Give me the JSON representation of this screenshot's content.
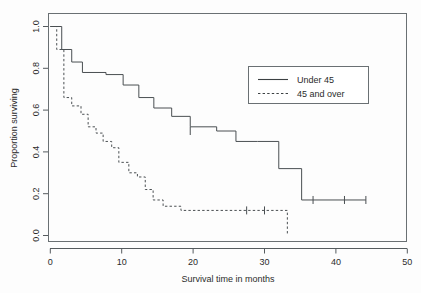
{
  "chart_data": {
    "type": "line",
    "title": "",
    "xlabel": "Survival time in months",
    "ylabel": "Proportion surviving",
    "xlim": [
      0,
      50
    ],
    "ylim": [
      0.0,
      1.0
    ],
    "xticks": [
      0,
      10,
      20,
      30,
      40,
      50
    ],
    "xticklabels": [
      "0",
      "10",
      "20",
      "30",
      "40",
      "50"
    ],
    "yticks": [
      0.0,
      0.2,
      0.4,
      0.6,
      0.8,
      1.0
    ],
    "yticklabels": [
      "0.0",
      "0.2",
      "0.4",
      "0.6",
      "0.8",
      "1.0"
    ],
    "grid": false,
    "legend_position": "upper right",
    "plot_style": "step-post",
    "series": [
      {
        "name": "Under 45",
        "style": "solid",
        "color": "#4a4f52",
        "x": [
          0.0,
          1.6,
          1.6,
          3.0,
          3.0,
          4.5,
          4.5,
          7.8,
          7.8,
          10.2,
          10.2,
          12.4,
          12.4,
          14.5,
          14.5,
          17.0,
          17.0,
          19.6,
          19.6,
          23.3,
          23.3,
          26.0,
          26.0,
          29.0,
          29.0,
          32.0,
          32.0,
          35.2,
          35.2,
          44.2
        ],
        "y": [
          1.0,
          1.0,
          0.89,
          0.89,
          0.83,
          0.83,
          0.78,
          0.78,
          0.77,
          0.77,
          0.72,
          0.72,
          0.66,
          0.66,
          0.61,
          0.61,
          0.57,
          0.57,
          0.52,
          0.52,
          0.5,
          0.5,
          0.45,
          0.45,
          0.45,
          0.45,
          0.32,
          0.32,
          0.17,
          0.17
        ],
        "censored_x": [
          19.6,
          36.8,
          41.2,
          44.2
        ],
        "censored_y": [
          0.5,
          0.17,
          0.17,
          0.17
        ]
      },
      {
        "name": "45 and over",
        "style": "dashed",
        "color": "#4a4f52",
        "x": [
          0.0,
          0.9,
          0.9,
          1.9,
          1.9,
          3.0,
          3.0,
          4.3,
          4.3,
          5.3,
          5.3,
          6.4,
          6.4,
          7.4,
          7.4,
          8.6,
          8.6,
          9.6,
          9.6,
          11.0,
          11.0,
          12.2,
          12.2,
          13.3,
          13.3,
          14.4,
          14.4,
          15.8,
          15.8,
          18.3,
          18.3,
          33.2,
          33.2
        ],
        "y": [
          1.0,
          1.0,
          0.89,
          0.89,
          0.66,
          0.66,
          0.62,
          0.62,
          0.58,
          0.58,
          0.52,
          0.52,
          0.49,
          0.49,
          0.45,
          0.45,
          0.42,
          0.42,
          0.35,
          0.35,
          0.3,
          0.3,
          0.28,
          0.28,
          0.22,
          0.22,
          0.17,
          0.17,
          0.14,
          0.14,
          0.12,
          0.12,
          0.0
        ],
        "censored_x": [
          27.5,
          30.0
        ],
        "censored_y": [
          0.12,
          0.12
        ]
      }
    ],
    "legend": [
      {
        "label": "Under 45",
        "style": "solid"
      },
      {
        "label": "45 and over",
        "style": "dashed"
      }
    ]
  },
  "legend": {
    "item_under_45": "Under 45",
    "item_45_and_over": "45 and over"
  },
  "axes": {
    "x_label": "Survival time in months",
    "y_label": "Proportion surviving",
    "x_tick_0": "0",
    "x_tick_1": "10",
    "x_tick_2": "20",
    "x_tick_3": "30",
    "x_tick_4": "40",
    "x_tick_5": "50",
    "y_tick_0": "0.0",
    "y_tick_1": "0.2",
    "y_tick_2": "0.4",
    "y_tick_3": "0.6",
    "y_tick_4": "0.8",
    "y_tick_5": "1.0"
  },
  "colors": {
    "curve": "#4a4f52",
    "frame": "#6a7073",
    "text": "#2b2b2b",
    "background": "#fdfdfd"
  }
}
